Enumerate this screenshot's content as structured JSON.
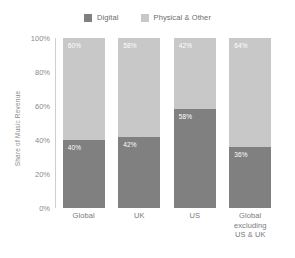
{
  "chart_data": {
    "type": "bar",
    "subtype": "stacked-100",
    "title": "",
    "xlabel": "",
    "ylabel": "Share of Music Revenue",
    "ylim": [
      0,
      100
    ],
    "grid": false,
    "legend_position": "top-center",
    "categories": [
      "Global",
      "UK",
      "US",
      "Global excluding US & UK"
    ],
    "category_lines": [
      [
        "Global"
      ],
      [
        "UK"
      ],
      [
        "US"
      ],
      [
        "Global",
        "excluding",
        "US & UK"
      ]
    ],
    "ytick_labels": [
      "100%",
      "80%",
      "60%",
      "40%",
      "20%",
      "0%"
    ],
    "ytick_values": [
      100,
      80,
      60,
      40,
      20,
      0
    ],
    "series": [
      {
        "name": "Digital",
        "color": "#808080",
        "values": [
          40,
          42,
          58,
          36
        ],
        "labels": [
          "40%",
          "42%",
          "58%",
          "36%"
        ]
      },
      {
        "name": "Physical & Other",
        "color": "#c8c8c8",
        "values": [
          60,
          58,
          42,
          64
        ],
        "labels": [
          "60%",
          "58%",
          "42%",
          "64%"
        ]
      }
    ]
  },
  "legend": {
    "items": [
      {
        "label": "Digital",
        "color": "#808080"
      },
      {
        "label": "Physical & Other",
        "color": "#c8c8c8"
      }
    ]
  },
  "colors": {
    "digital": "#808080",
    "physical": "#c8c8c8",
    "axis": "#cfcfcf",
    "tick_text": "#8a8a8a",
    "label_text": "#7a7a7a",
    "value_text": "#ffffff",
    "background": "#ffffff"
  }
}
